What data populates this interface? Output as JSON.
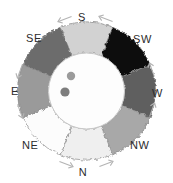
{
  "figure": {
    "name": "compass-rose-segment-diagram",
    "background_color": "#ffffff",
    "width": 173,
    "height": 183
  },
  "labels": [
    {
      "id": "s",
      "text": "S",
      "x": 82,
      "y": 12,
      "anchor": "center"
    },
    {
      "id": "se",
      "text": "SE",
      "x": 26,
      "y": 33,
      "anchor": "left"
    },
    {
      "id": "sw",
      "text": "SW",
      "x": 133,
      "y": 34,
      "anchor": "left"
    },
    {
      "id": "e",
      "text": "E",
      "x": 11,
      "y": 86,
      "anchor": "left"
    },
    {
      "id": "w",
      "text": "W",
      "x": 152,
      "y": 88,
      "anchor": "left"
    },
    {
      "id": "ne",
      "text": "NE",
      "x": 22,
      "y": 140,
      "anchor": "left"
    },
    {
      "id": "nw",
      "text": "NW",
      "x": 130,
      "y": 140,
      "anchor": "left"
    },
    {
      "id": "n",
      "text": "N",
      "x": 83,
      "y": 167,
      "anchor": "center"
    }
  ],
  "ring": {
    "center_x": 86.5,
    "center_y": 91,
    "outer_radius": 69,
    "inner_radius": 38,
    "outline_color": "#8d8d8d",
    "segments": [
      {
        "direction": "S",
        "label": "S",
        "color": "#d2d2d2",
        "start_deg": 247.5,
        "end_deg": 292.5
      },
      {
        "direction": "SW",
        "label": "SW",
        "color": "#0a0a0a",
        "start_deg": 292.5,
        "end_deg": 337.5
      },
      {
        "direction": "W",
        "label": "W",
        "color": "#5f5f5f",
        "start_deg": 337.5,
        "end_deg": 22.5
      },
      {
        "direction": "NW",
        "label": "NW",
        "color": "#a8a8a8",
        "start_deg": 22.5,
        "end_deg": 67.5
      },
      {
        "direction": "N",
        "label": "N",
        "color": "#efefef",
        "start_deg": 67.5,
        "end_deg": 112.5
      },
      {
        "direction": "NE",
        "label": "NE",
        "color": "#fcfcfc",
        "start_deg": 112.5,
        "end_deg": 157.5
      },
      {
        "direction": "E",
        "label": "E",
        "color": "#9a9a9a",
        "start_deg": 157.5,
        "end_deg": 202.5
      },
      {
        "direction": "SE",
        "label": "SE",
        "color": "#6c6c6c",
        "start_deg": 202.5,
        "end_deg": 247.5
      }
    ]
  },
  "inner_disc": {
    "fill": "#fdfdfd",
    "stroke": "#c9c9c9",
    "radius": 38
  },
  "markers": [
    {
      "id": "dot-upper",
      "x": 71,
      "y": 76,
      "r": 4.2,
      "color": "#9b9b9b"
    },
    {
      "id": "dot-lower",
      "x": 65,
      "y": 92,
      "r": 4.6,
      "color": "#7d7d7d"
    }
  ],
  "arrows": {
    "color": "#b3b3b3",
    "items": [
      {
        "id": "arrow-s-left",
        "x": 65,
        "y": 19,
        "rotation": -110
      },
      {
        "id": "arrow-s-right",
        "x": 106,
        "y": 19,
        "rotation": -70
      },
      {
        "id": "arrow-w-upper",
        "x": 152,
        "y": 70,
        "rotation": -20
      },
      {
        "id": "arrow-w-lower",
        "x": 152,
        "y": 110,
        "rotation": 20
      },
      {
        "id": "arrow-n-right",
        "x": 106,
        "y": 164,
        "rotation": 70
      },
      {
        "id": "arrow-n-left",
        "x": 66,
        "y": 164,
        "rotation": 110
      },
      {
        "id": "arrow-e-lower",
        "x": 20,
        "y": 111,
        "rotation": 160
      },
      {
        "id": "arrow-e-upper",
        "x": 20,
        "y": 71,
        "rotation": 200
      }
    ]
  }
}
